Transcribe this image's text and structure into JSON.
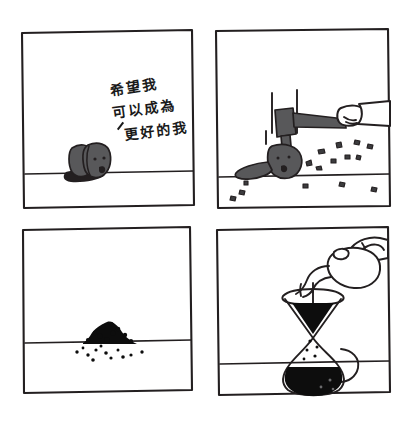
{
  "comic": {
    "title": "Coffee Bean Comic",
    "style": "hand-drawn four panel black and white comic",
    "panel_count": 4,
    "background_color": "#ffffff",
    "ink_color": "#231f20",
    "bean_fill_color": "#58585a",
    "grounds_color": "#0d0d0d",
    "panels": [
      {
        "index": 1,
        "position": "top-left",
        "caption_lines": [
          "希望我",
          "可以成為",
          "更好的我"
        ],
        "caption_full": "希望我可以成為更好的我",
        "caption_translation": "I hope I can become a better me",
        "scene": "sad coffee bean lying on the ground with a shadow",
        "elements": [
          "coffee-bean-character",
          "bean-sad-face",
          "bean-shadow",
          "horizon-line",
          "handwritten-caption"
        ]
      },
      {
        "index": 2,
        "position": "top-right",
        "caption_lines": [],
        "scene": "a hand swings a mallet and smashes the coffee bean, fragments fly",
        "elements": [
          "hand",
          "sleeve",
          "mallet-handle",
          "mallet-head",
          "impact-lines",
          "crushed-bean",
          "bean-fragments",
          "horizon-line"
        ]
      },
      {
        "index": 3,
        "position": "bottom-left",
        "caption_lines": [],
        "scene": "a small mound of ground coffee rests on the ground with scattered grains",
        "elements": [
          "coffee-grounds-pile",
          "scattered-grounds",
          "horizon-line"
        ]
      },
      {
        "index": 4,
        "position": "bottom-right",
        "caption_lines": [],
        "scene": "a hand pours hot water from a gooseneck kettle into a chemex pour-over brewer full of coffee",
        "elements": [
          "hand",
          "kettle",
          "kettle-spout",
          "water-stream",
          "chemex-brewer",
          "brewer-collar",
          "coffee-grounds-cone",
          "coffee-drips",
          "brewed-coffee",
          "horizon-line"
        ]
      }
    ]
  }
}
